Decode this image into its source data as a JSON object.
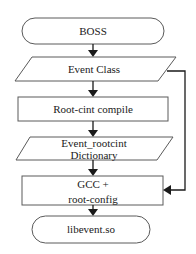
{
  "diagram": {
    "type": "flowchart",
    "nodes": [
      {
        "id": "boss",
        "shape": "terminator",
        "label": "BOSS"
      },
      {
        "id": "event_class",
        "shape": "parallelogram",
        "label": "Event Class"
      },
      {
        "id": "rootcint_compile",
        "shape": "process",
        "label": "Root-cint compile"
      },
      {
        "id": "dictionary",
        "shape": "parallelogram",
        "label_line1": "Event_rootcint",
        "label_line2": "Dictionary"
      },
      {
        "id": "gcc",
        "shape": "process",
        "label_line1": "GCC +",
        "label_line2": "root-config"
      },
      {
        "id": "libevent",
        "shape": "terminator",
        "label": "libevent.so"
      }
    ],
    "edges": [
      {
        "from": "boss",
        "to": "event_class"
      },
      {
        "from": "event_class",
        "to": "rootcint_compile"
      },
      {
        "from": "rootcint_compile",
        "to": "dictionary"
      },
      {
        "from": "dictionary",
        "to": "gcc"
      },
      {
        "from": "gcc",
        "to": "libevent"
      },
      {
        "from": "event_class",
        "to": "gcc",
        "route": "right-side bypass"
      }
    ]
  }
}
